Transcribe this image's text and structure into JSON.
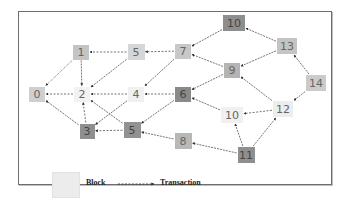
{
  "diagram": {
    "type": "transaction-dag",
    "nodes": [
      {
        "id": "n0",
        "label": "0",
        "x": 37,
        "y": 94,
        "w": 16,
        "h": 15,
        "color": "#cfcfcf"
      },
      {
        "id": "n1",
        "label": "1",
        "x": 81,
        "y": 52,
        "w": 16,
        "h": 15,
        "color": "#c4c4c4"
      },
      {
        "id": "n2",
        "label": "2",
        "x": 82,
        "y": 94,
        "w": 16,
        "h": 15,
        "color": "#f2f2f2"
      },
      {
        "id": "n3",
        "label": "3",
        "x": 87,
        "y": 131,
        "w": 15,
        "h": 15,
        "color": "#8f8f8f"
      },
      {
        "id": "n4",
        "label": "4",
        "x": 136,
        "y": 94,
        "w": 16,
        "h": 15,
        "color": "#f0f0f0"
      },
      {
        "id": "n5a",
        "label": "5",
        "x": 136,
        "y": 52,
        "w": 17,
        "h": 16,
        "color": "#d6d6d6"
      },
      {
        "id": "n5b",
        "label": "5",
        "x": 132,
        "y": 130,
        "w": 17,
        "h": 16,
        "color": "#929292"
      },
      {
        "id": "n6",
        "label": "6",
        "x": 183,
        "y": 94,
        "w": 16,
        "h": 15,
        "color": "#8a8a8a"
      },
      {
        "id": "n7",
        "label": "7",
        "x": 183,
        "y": 51,
        "w": 16,
        "h": 15,
        "color": "#c8c8c8"
      },
      {
        "id": "n8",
        "label": "8",
        "x": 183,
        "y": 141,
        "w": 17,
        "h": 16,
        "color": "#b8b8b8"
      },
      {
        "id": "n9",
        "label": "9",
        "x": 232,
        "y": 70,
        "w": 16,
        "h": 15,
        "color": "#b4b4b4"
      },
      {
        "id": "n10a",
        "label": "10",
        "x": 234,
        "y": 23,
        "w": 22,
        "h": 16,
        "color": "#8e8e8e"
      },
      {
        "id": "n10b",
        "label": "10",
        "x": 232,
        "y": 115,
        "w": 22,
        "h": 16,
        "color": "#f0f0f0"
      },
      {
        "id": "n11",
        "label": "11",
        "x": 246,
        "y": 155,
        "w": 17,
        "h": 16,
        "color": "#8f8f8f"
      },
      {
        "id": "n12",
        "label": "12",
        "x": 283,
        "y": 109,
        "w": 20,
        "h": 16,
        "color": "#ededed"
      },
      {
        "id": "n13",
        "label": "13",
        "x": 287,
        "y": 46,
        "w": 20,
        "h": 16,
        "color": "#c4c4c4"
      },
      {
        "id": "n14",
        "label": "14",
        "x": 316,
        "y": 83,
        "w": 20,
        "h": 16,
        "color": "#cbcbcb"
      }
    ],
    "edges": [
      {
        "from": "n1",
        "to": "n0",
        "style": "dotted"
      },
      {
        "from": "n1",
        "to": "n2",
        "style": "solid"
      },
      {
        "from": "n5a",
        "to": "n1",
        "style": "dashed"
      },
      {
        "from": "n5a",
        "to": "n2",
        "style": "solid"
      },
      {
        "from": "n2",
        "to": "n0",
        "style": "dashed"
      },
      {
        "from": "n3",
        "to": "n0",
        "style": "solid"
      },
      {
        "from": "n3",
        "to": "n2",
        "style": "dashed"
      },
      {
        "from": "n4",
        "to": "n2",
        "style": "dashed"
      },
      {
        "from": "n4",
        "to": "n3",
        "style": "solid"
      },
      {
        "from": "n5b",
        "to": "n2",
        "style": "solid"
      },
      {
        "from": "n5b",
        "to": "n3",
        "style": "dashed"
      },
      {
        "from": "n7",
        "to": "n5a",
        "style": "dashed"
      },
      {
        "from": "n7",
        "to": "n4",
        "style": "solid"
      },
      {
        "from": "n6",
        "to": "n4",
        "style": "dashed"
      },
      {
        "from": "n6",
        "to": "n5b",
        "style": "solid"
      },
      {
        "from": "n8",
        "to": "n5b",
        "style": "solid"
      },
      {
        "from": "n9",
        "to": "n7",
        "style": "solid"
      },
      {
        "from": "n9",
        "to": "n6",
        "style": "solid"
      },
      {
        "from": "n10a",
        "to": "n7",
        "style": "solid"
      },
      {
        "from": "n10b",
        "to": "n6",
        "style": "solid"
      },
      {
        "from": "n13",
        "to": "n10a",
        "style": "solid"
      },
      {
        "from": "n13",
        "to": "n9",
        "style": "solid"
      },
      {
        "from": "n12",
        "to": "n9",
        "style": "solid"
      },
      {
        "from": "n12",
        "to": "n10b",
        "style": "dashed"
      },
      {
        "from": "n14",
        "to": "n13",
        "style": "solid"
      },
      {
        "from": "n14",
        "to": "n12",
        "style": "solid"
      },
      {
        "from": "n11",
        "to": "n10b",
        "style": "solid"
      },
      {
        "from": "n11",
        "to": "n12",
        "style": "solid"
      },
      {
        "from": "n11",
        "to": "n8",
        "style": "solid"
      }
    ]
  },
  "legend": {
    "block_label": "Block",
    "transaction_label": "Transaction",
    "block_color": "#ececec"
  },
  "colors": {
    "edge": "#3a3a3a",
    "frame": "#6e6e6e",
    "text": "#555555"
  }
}
